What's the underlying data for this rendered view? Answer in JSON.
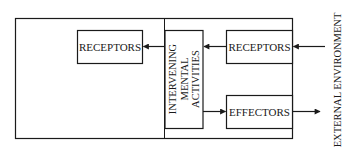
{
  "diagram": {
    "boxes": {
      "receptors_inner": "RECEPTORS",
      "mental_activities": [
        "INTERVENING",
        "MENTAL",
        "ACTIVITIES"
      ],
      "receptors_outer": "RECEPTORS",
      "effectors": "EFFECTORS"
    },
    "environment_label": "EXTERNAL ENVIRONMENT",
    "connections": [
      {
        "from": "external-environment",
        "to": "receptors_outer"
      },
      {
        "from": "receptors_outer",
        "to": "mental_activities"
      },
      {
        "from": "mental_activities",
        "to": "receptors_inner"
      },
      {
        "from": "mental_activities",
        "to": "effectors"
      },
      {
        "from": "effectors",
        "to": "external-environment"
      }
    ],
    "colors": {
      "line": "#1a1a1a",
      "background": "#ffffff"
    }
  }
}
